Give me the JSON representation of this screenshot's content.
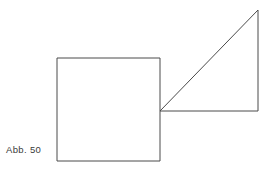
{
  "figure": {
    "caption": "Abb. 50",
    "background_color": "#ffffff",
    "stroke_color": "#4a4a4a",
    "caption_color": "#3a3a3a",
    "stroke_width": 1,
    "canvas": {
      "width": 275,
      "height": 175
    }
  },
  "chart_data": {
    "type": "diagram",
    "title": "Abb. 50",
    "subtitle": "",
    "xlabel": "",
    "ylabel": "",
    "grid": false,
    "legend": "none",
    "coordinate_system": "pixels, origin top-left",
    "xlim": [
      0,
      275
    ],
    "ylim": [
      0,
      175
    ],
    "shapes": [
      {
        "name": "square",
        "type": "polygon",
        "closed": true,
        "fill": "none",
        "stroke": "#4a4a4a",
        "side_length": 103,
        "vertices": [
          {
            "label": "top-left",
            "x": 57,
            "y": 58
          },
          {
            "label": "top-right",
            "x": 160,
            "y": 58
          },
          {
            "label": "bottom-right",
            "x": 160,
            "y": 161
          },
          {
            "label": "bottom-left",
            "x": 57,
            "y": 161
          }
        ]
      },
      {
        "name": "right-triangle",
        "type": "polygon",
        "closed": true,
        "fill": "none",
        "stroke": "#4a4a4a",
        "base_length": 98,
        "height_length": 102,
        "right_angle_at": "bottom-right",
        "vertices": [
          {
            "label": "left-vertex",
            "x": 160,
            "y": 111
          },
          {
            "label": "apex-top-right",
            "x": 258,
            "y": 10
          },
          {
            "label": "bottom-right",
            "x": 258,
            "y": 111
          }
        ]
      }
    ],
    "annotations": [
      {
        "text": "Abb. 50",
        "x": 6,
        "y": 152,
        "role": "figure-caption"
      }
    ]
  }
}
